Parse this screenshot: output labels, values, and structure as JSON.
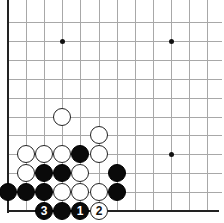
{
  "board": {
    "visible_columns": 12,
    "visible_rows": 11,
    "origin_x": 8,
    "origin_y": 22,
    "spacing_x": 18.1,
    "spacing_y": 18.9,
    "edges": [
      "left",
      "bottom"
    ],
    "grid_color": "#a8a8a8",
    "edge_color": "#222222"
  },
  "star_points": [
    {
      "col": 3,
      "row": 1
    },
    {
      "col": 9,
      "row": 1
    },
    {
      "col": 9,
      "row": 7
    }
  ],
  "stones": [
    {
      "color": "white",
      "col": 3,
      "row": 5,
      "label": ""
    },
    {
      "color": "white",
      "col": 5,
      "row": 6,
      "label": ""
    },
    {
      "color": "white",
      "col": 1,
      "row": 7,
      "label": ""
    },
    {
      "color": "white",
      "col": 2,
      "row": 7,
      "label": ""
    },
    {
      "color": "white",
      "col": 3,
      "row": 7,
      "label": ""
    },
    {
      "color": "black",
      "col": 4,
      "row": 7,
      "label": ""
    },
    {
      "color": "white",
      "col": 5,
      "row": 7,
      "label": ""
    },
    {
      "color": "white",
      "col": 1,
      "row": 8,
      "label": ""
    },
    {
      "color": "black",
      "col": 2,
      "row": 8,
      "label": ""
    },
    {
      "color": "black",
      "col": 3,
      "row": 8,
      "label": ""
    },
    {
      "color": "white",
      "col": 4,
      "row": 8,
      "label": ""
    },
    {
      "color": "black",
      "col": 6,
      "row": 8,
      "label": ""
    },
    {
      "color": "black",
      "col": 0,
      "row": 9,
      "label": ""
    },
    {
      "color": "black",
      "col": 1,
      "row": 9,
      "label": ""
    },
    {
      "color": "black",
      "col": 2,
      "row": 9,
      "label": ""
    },
    {
      "color": "white",
      "col": 3,
      "row": 9,
      "label": ""
    },
    {
      "color": "white",
      "col": 4,
      "row": 9,
      "label": ""
    },
    {
      "color": "white",
      "col": 5,
      "row": 9,
      "label": ""
    },
    {
      "color": "black",
      "col": 6,
      "row": 9,
      "label": ""
    },
    {
      "color": "black",
      "col": 2,
      "row": 10,
      "label": "3"
    },
    {
      "color": "black",
      "col": 3,
      "row": 10,
      "label": ""
    },
    {
      "color": "black",
      "col": 4,
      "row": 10,
      "label": "1"
    },
    {
      "color": "white",
      "col": 5,
      "row": 10,
      "label": "2"
    }
  ]
}
